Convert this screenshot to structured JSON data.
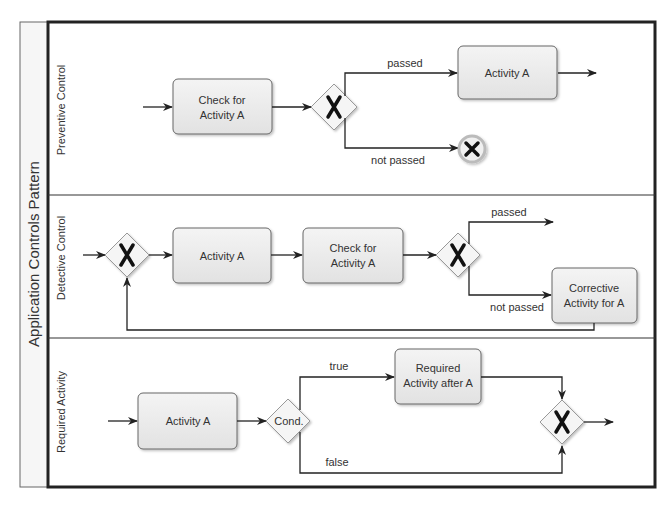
{
  "pool": {
    "title": "Application Controls Pattern"
  },
  "lanes": [
    {
      "name": "Preventive Control",
      "tasks": [
        "Check for",
        "Activity A",
        "Activity A"
      ],
      "edges": {
        "passed": "passed",
        "not_passed": "not passed"
      }
    },
    {
      "name": "Detective Control",
      "tasks": [
        "Activity A",
        "Check for",
        "Activity A",
        "Corrective",
        "Activity for A"
      ],
      "edges": {
        "passed": "passed",
        "not_passed": "not passed"
      }
    },
    {
      "name": "Required Activity",
      "tasks": [
        "Activity A",
        "Required",
        "Activity after A"
      ],
      "gateway": "Cond.",
      "edges": {
        "true": "true",
        "false": "false"
      }
    }
  ],
  "colors": {
    "task_fill": "#ececec",
    "stroke": "#555555",
    "frame": "#222222",
    "end_ring": "#bbbbbb"
  }
}
